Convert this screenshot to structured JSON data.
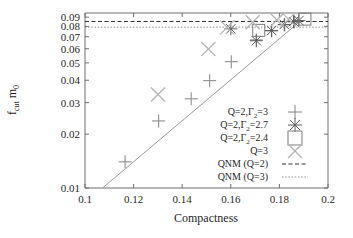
{
  "chart_data": {
    "type": "scatter",
    "title": "",
    "xlabel": "Compactness",
    "ylabel_main": "f",
    "ylabel_sub": "cut",
    "ylabel_tail": "m",
    "ylabel_tail_sub": "0",
    "ylabel": "f_cut m_0",
    "xlim": [
      0.1,
      0.2
    ],
    "ylim": [
      0.01,
      0.095
    ],
    "xscale": "linear",
    "yscale": "log",
    "grid": false,
    "legend_position": "inside-right-middle",
    "xticks": [
      "0.1",
      "0.12",
      "0.14",
      "0.16",
      "0.18",
      "0.2"
    ],
    "xtick_values": [
      0.1,
      0.12,
      0.14,
      0.16,
      0.18,
      0.2
    ],
    "yticks": [
      "0.01",
      "0.02",
      "0.03",
      "0.04",
      "0.05",
      "0.06",
      "0.07",
      "0.08",
      "0.09"
    ],
    "ytick_values": [
      0.01,
      0.02,
      0.03,
      0.04,
      0.05,
      0.06,
      0.07,
      0.08,
      0.09
    ],
    "series": [
      {
        "name": "Q=2,Γ₂=3",
        "label_main": "Q=2,Γ",
        "label_sub": "2",
        "label_tail": "=3",
        "marker": "plus",
        "color": "#8e8e8e",
        "points": [
          [
            0.1165,
            0.014
          ],
          [
            0.1303,
            0.0237
          ],
          [
            0.1437,
            0.0315
          ],
          [
            0.1513,
            0.0398
          ],
          [
            0.1602,
            0.0508
          ],
          [
            0.1705,
            0.0672
          ],
          [
            0.1768,
            0.0755
          ],
          [
            0.1822,
            0.0815
          ],
          [
            0.1862,
            0.0848
          ]
        ]
      },
      {
        "name": "Q=2,Γ₂=2.7",
        "label_main": "Q=2,Γ",
        "label_sub": "2",
        "label_tail": "=2.7",
        "marker": "star",
        "color": "#5d5d5d",
        "points": [
          [
            0.16,
            0.0775
          ],
          [
            0.1705,
            0.0665
          ],
          [
            0.1768,
            0.0758
          ],
          [
            0.182,
            0.082
          ],
          [
            0.1858,
            0.085
          ],
          [
            0.188,
            0.0862
          ]
        ]
      },
      {
        "name": "Q=2,Γ₂=2.4",
        "label_main": "Q=2,Γ",
        "label_sub": "2",
        "label_tail": "=2.4",
        "marker": "square",
        "color": "#7a7a7a",
        "points": [
          [
            0.1715,
            0.076
          ],
          [
            0.1905,
            0.0878
          ]
        ]
      },
      {
        "name": "Q=3",
        "label_main": "Q=3",
        "label_sub": "",
        "label_tail": "",
        "marker": "cross",
        "color": "#b4b4b4",
        "points": [
          [
            0.13,
            0.0333
          ],
          [
            0.1508,
            0.0598
          ],
          [
            0.1585,
            0.079
          ],
          [
            0.169,
            0.0843
          ],
          [
            0.179,
            0.0868
          ],
          [
            0.1838,
            0.0875
          ]
        ]
      }
    ],
    "reference_lines": [
      {
        "name": "QNM (Q=2)",
        "label": "QNM (Q=2)",
        "style": "dashed",
        "value": 0.0852,
        "color": "#2f2f2f"
      },
      {
        "name": "QNM (Q=3)",
        "label": "QNM (Q=3)",
        "style": "dotted",
        "value": 0.0792,
        "color": "#8a8a8a"
      }
    ],
    "fit_line": {
      "name": "fit-line",
      "color": "#9a9a9a",
      "points": [
        [
          0.1072,
          0.01
        ],
        [
          0.189,
          0.0865
        ]
      ]
    }
  }
}
